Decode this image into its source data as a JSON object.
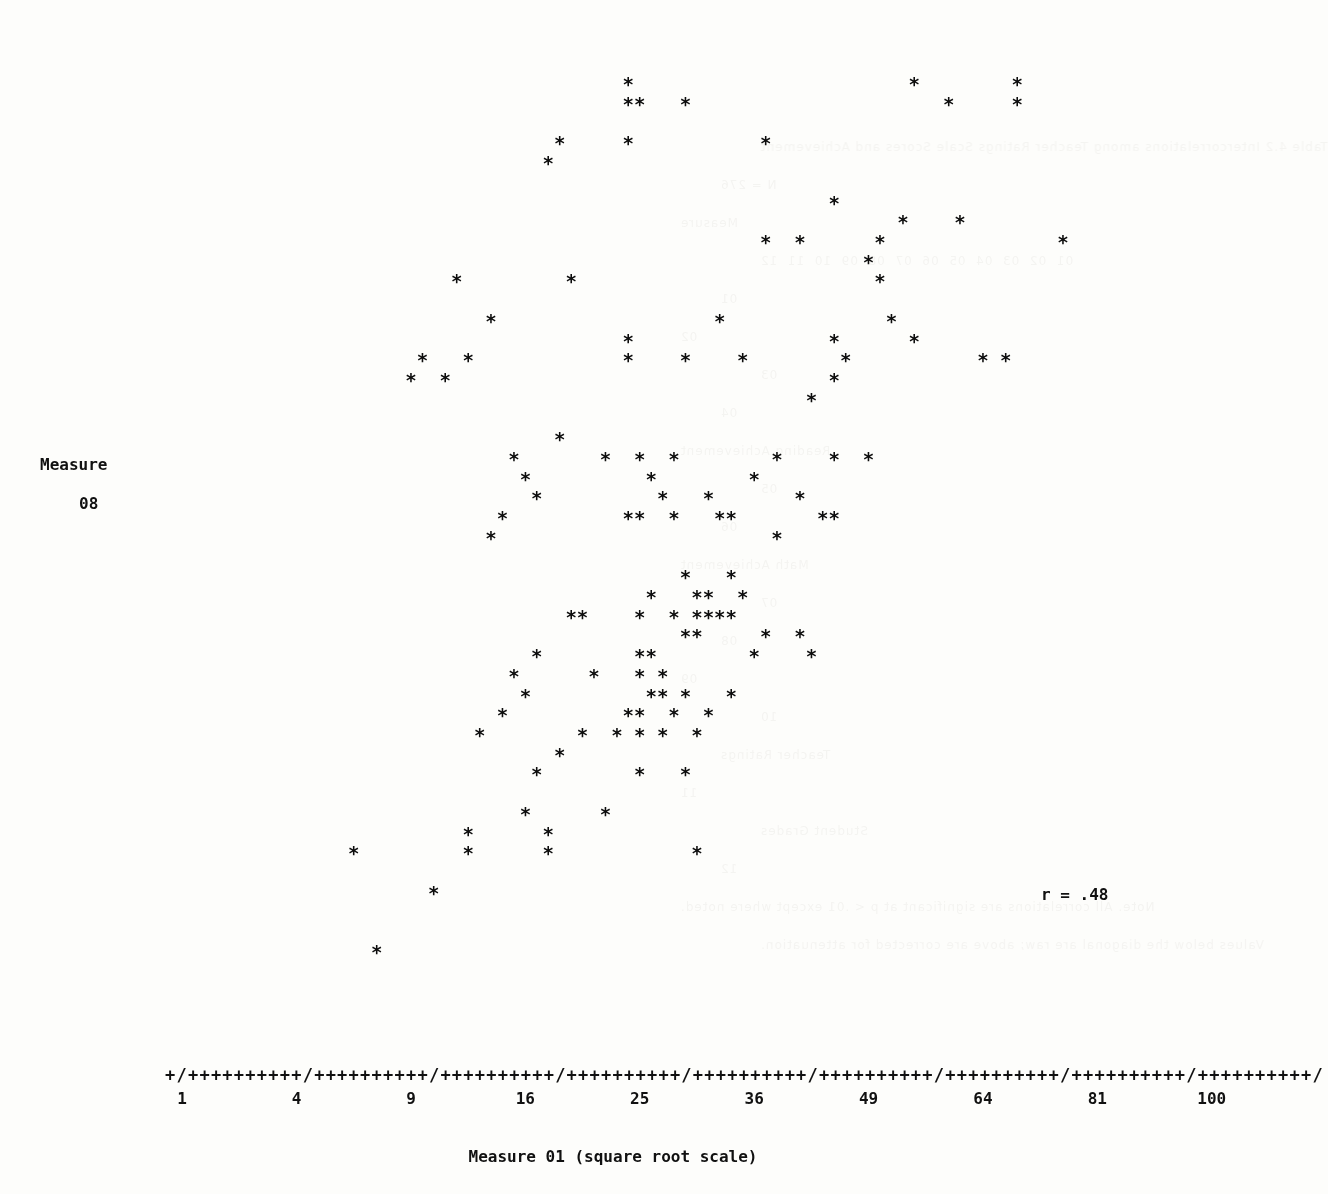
{
  "chart_data": {
    "type": "scatter",
    "title": "",
    "xlabel": "Measure 01 (square root scale)",
    "ylabel_line1": "Measure",
    "ylabel_line2": "08",
    "annotation": "r = .48",
    "correlation": 0.48,
    "point_marker": "*",
    "axis_tick_char": "+",
    "axis_major_char": "/",
    "grid": false,
    "legend": null,
    "xscale": "square-root",
    "xlim": [
      1,
      100
    ],
    "ylim": [
      0.0,
      5.0
    ],
    "x_tick_labels": [
      "1",
      "4",
      "9",
      "16",
      "25",
      "36",
      "49",
      "64",
      "81",
      "100"
    ],
    "x_tick_values": [
      1,
      4,
      9,
      16,
      25,
      36,
      49,
      64,
      81,
      100
    ],
    "y_tick_labels": [
      "5.0++",
      "4.0++",
      "3.0++",
      "2.0++",
      "1.0++",
      "0.0"
    ],
    "y_tick_values": [
      5.0,
      4.0,
      3.0,
      2.0,
      1.0,
      0.0
    ],
    "y_minor_ticks_between": 9,
    "x_axis_rule": "+/++++++++++/++++++++++/++++++++++/++++++++++/++++++++++/++++++++++/++++++++++/++++++++++/++++++++++/",
    "geometry": {
      "origin_x": 165,
      "baseline_y": 1080,
      "char_width": 11.44,
      "row_height": 19.72,
      "cols_per_xtick": 10,
      "rows_per_yunit": 10
    },
    "points_grid": [
      [
        40,
        50
      ],
      [
        65,
        50
      ],
      [
        74,
        50
      ],
      [
        40,
        49
      ],
      [
        41,
        49
      ],
      [
        45,
        49
      ],
      [
        68,
        49
      ],
      [
        74,
        49
      ],
      [
        34,
        47
      ],
      [
        40,
        47
      ],
      [
        52,
        47
      ],
      [
        33,
        46
      ],
      [
        58,
        44
      ],
      [
        64,
        43
      ],
      [
        69,
        43
      ],
      [
        52,
        42
      ],
      [
        55,
        42
      ],
      [
        62,
        42
      ],
      [
        78,
        42
      ],
      [
        61,
        41
      ],
      [
        25,
        40
      ],
      [
        35,
        40
      ],
      [
        62,
        40
      ],
      [
        28,
        38
      ],
      [
        48,
        38
      ],
      [
        63,
        38
      ],
      [
        40,
        37
      ],
      [
        58,
        37
      ],
      [
        65,
        37
      ],
      [
        22,
        36
      ],
      [
        26,
        36
      ],
      [
        40,
        36
      ],
      [
        45,
        36
      ],
      [
        50,
        36
      ],
      [
        59,
        36
      ],
      [
        71,
        36
      ],
      [
        73,
        36
      ],
      [
        21,
        35
      ],
      [
        24,
        35
      ],
      [
        58,
        35
      ],
      [
        56,
        34
      ],
      [
        34,
        32
      ],
      [
        30,
        31
      ],
      [
        38,
        31
      ],
      [
        41,
        31
      ],
      [
        44,
        31
      ],
      [
        53,
        31
      ],
      [
        58,
        31
      ],
      [
        61,
        31
      ],
      [
        31,
        30
      ],
      [
        42,
        30
      ],
      [
        51,
        30
      ],
      [
        32,
        29
      ],
      [
        43,
        29
      ],
      [
        47,
        29
      ],
      [
        55,
        29
      ],
      [
        29,
        28
      ],
      [
        40,
        28
      ],
      [
        41,
        28
      ],
      [
        44,
        28
      ],
      [
        48,
        28
      ],
      [
        49,
        28
      ],
      [
        57,
        28
      ],
      [
        58,
        28
      ],
      [
        28,
        27
      ],
      [
        53,
        27
      ],
      [
        45,
        25
      ],
      [
        49,
        25
      ],
      [
        42,
        24
      ],
      [
        46,
        24
      ],
      [
        47,
        24
      ],
      [
        50,
        24
      ],
      [
        35,
        23
      ],
      [
        36,
        23
      ],
      [
        41,
        23
      ],
      [
        44,
        23
      ],
      [
        46,
        23
      ],
      [
        47,
        23
      ],
      [
        48,
        23
      ],
      [
        49,
        23
      ],
      [
        45,
        22
      ],
      [
        46,
        22
      ],
      [
        52,
        22
      ],
      [
        55,
        22
      ],
      [
        32,
        21
      ],
      [
        41,
        21
      ],
      [
        42,
        21
      ],
      [
        51,
        21
      ],
      [
        56,
        21
      ],
      [
        30,
        20
      ],
      [
        37,
        20
      ],
      [
        41,
        20
      ],
      [
        43,
        20
      ],
      [
        31,
        19
      ],
      [
        42,
        19
      ],
      [
        43,
        19
      ],
      [
        45,
        19
      ],
      [
        49,
        19
      ],
      [
        29,
        18
      ],
      [
        40,
        18
      ],
      [
        41,
        18
      ],
      [
        44,
        18
      ],
      [
        47,
        18
      ],
      [
        27,
        17
      ],
      [
        36,
        17
      ],
      [
        39,
        17
      ],
      [
        41,
        17
      ],
      [
        43,
        17
      ],
      [
        46,
        17
      ],
      [
        34,
        16
      ],
      [
        32,
        15
      ],
      [
        41,
        15
      ],
      [
        45,
        15
      ],
      [
        31,
        13
      ],
      [
        38,
        13
      ],
      [
        26,
        12
      ],
      [
        33,
        12
      ],
      [
        16,
        11
      ],
      [
        26,
        11
      ],
      [
        33,
        11
      ],
      [
        46,
        11
      ],
      [
        23,
        9
      ],
      [
        18,
        6
      ]
    ]
  },
  "bleed_through": {
    "visible": true,
    "lines": [
      "Table 4.2 Intercorrelations among Teacher Ratings Scale Scores and Achievement",
      "N = 276",
      "Measure",
      "01  02  03  04  05  06  07  08  09  10  11  12",
      "01",
      "02",
      "03",
      "04",
      "Reading Achievement",
      "05",
      "06",
      "Math Achievement",
      "07",
      "08",
      "09",
      "10",
      "Teacher Ratings",
      "11",
      "Student Grades",
      "12",
      "Note. All correlations are significant at p < .01 except where noted.",
      "Values below the diagonal are raw; above are corrected for attenuation."
    ]
  }
}
